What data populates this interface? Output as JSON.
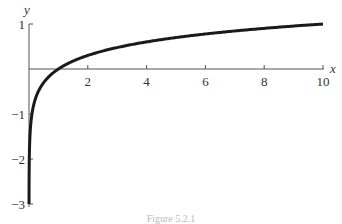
{
  "chart_data": {
    "type": "line",
    "title": "",
    "function": "y = ln(x)",
    "xlabel": "x",
    "ylabel": "y",
    "xlim": [
      0,
      10
    ],
    "ylim": [
      -3,
      1
    ],
    "x_ticks": [
      2,
      4,
      6,
      8,
      10
    ],
    "x_tick_labels": [
      "2",
      "4",
      "6",
      "8",
      "10"
    ],
    "y_ticks": [
      1,
      -1,
      -2,
      -3
    ],
    "y_tick_labels": [
      "1",
      "−1",
      "−2",
      "−3"
    ],
    "grid": false,
    "legend": null,
    "series": [
      {
        "name": "ln x",
        "x": [
          0.05,
          0.1,
          0.2,
          0.37,
          0.5,
          1,
          1.5,
          2,
          3,
          4,
          5,
          6,
          7,
          8,
          9,
          10
        ],
        "values": [
          -3.0,
          -2.3,
          -1.61,
          -1.0,
          -0.69,
          0,
          0.41,
          0.69,
          1.1,
          1.39,
          1.61,
          1.79,
          1.95,
          2.08,
          2.2,
          2.3
        ]
      }
    ],
    "color": "#1a1a1a"
  },
  "caption": "Figure 5.2.1"
}
